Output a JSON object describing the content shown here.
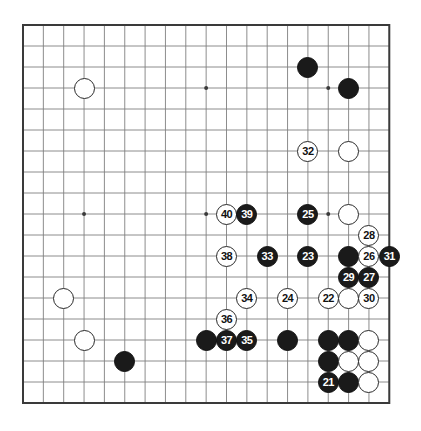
{
  "diagram": {
    "kind": "go-board-diagram",
    "board_size": 19,
    "colors": {
      "background": "#ffffff",
      "grid_line": "#808080",
      "border_line": "#3a3a3a",
      "black_stone": "#1a1a1a",
      "white_stone": "#ffffff",
      "stone_outline": "#2a2a2a",
      "black_label_text": "#ffffff",
      "white_label_text": "#111111"
    },
    "geometry": {
      "origin_x": 23,
      "origin_y": 25,
      "step_x": 20.35,
      "step_y": 21.0,
      "stone_diameter": 21,
      "star_point_radius": 2
    },
    "star_points": [
      {
        "col": 3,
        "row": 3
      },
      {
        "col": 9,
        "row": 3
      },
      {
        "col": 15,
        "row": 3
      },
      {
        "col": 3,
        "row": 9
      },
      {
        "col": 9,
        "row": 9
      },
      {
        "col": 15,
        "row": 9
      },
      {
        "col": 3,
        "row": 15
      },
      {
        "col": 9,
        "row": 15
      },
      {
        "col": 15,
        "row": 15
      }
    ],
    "stones": [
      {
        "col": 3,
        "row": 3,
        "color": "white",
        "label": ""
      },
      {
        "col": 14,
        "row": 2,
        "color": "black",
        "label": ""
      },
      {
        "col": 16,
        "row": 3,
        "color": "black",
        "label": ""
      },
      {
        "col": 14,
        "row": 6,
        "color": "white",
        "label": "32"
      },
      {
        "col": 16,
        "row": 6,
        "color": "white",
        "label": ""
      },
      {
        "col": 10,
        "row": 9,
        "color": "white",
        "label": "40"
      },
      {
        "col": 11,
        "row": 9,
        "color": "black",
        "label": "39"
      },
      {
        "col": 14,
        "row": 9,
        "color": "black",
        "label": "25"
      },
      {
        "col": 16,
        "row": 9,
        "color": "white",
        "label": ""
      },
      {
        "col": 17,
        "row": 10,
        "color": "white",
        "label": "28"
      },
      {
        "col": 10,
        "row": 11,
        "color": "white",
        "label": "38"
      },
      {
        "col": 12,
        "row": 11,
        "color": "black",
        "label": "33"
      },
      {
        "col": 14,
        "row": 11,
        "color": "black",
        "label": "23"
      },
      {
        "col": 16,
        "row": 11,
        "color": "black",
        "label": ""
      },
      {
        "col": 17,
        "row": 11,
        "color": "white",
        "label": "26"
      },
      {
        "col": 18,
        "row": 11,
        "color": "black",
        "label": "31"
      },
      {
        "col": 16,
        "row": 12,
        "color": "black",
        "label": "29"
      },
      {
        "col": 17,
        "row": 12,
        "color": "black",
        "label": "27"
      },
      {
        "col": 2,
        "row": 13,
        "color": "white",
        "label": ""
      },
      {
        "col": 11,
        "row": 13,
        "color": "white",
        "label": "34"
      },
      {
        "col": 13,
        "row": 13,
        "color": "white",
        "label": "24"
      },
      {
        "col": 15,
        "row": 13,
        "color": "white",
        "label": "22"
      },
      {
        "col": 16,
        "row": 13,
        "color": "white",
        "label": ""
      },
      {
        "col": 17,
        "row": 13,
        "color": "white",
        "label": "30"
      },
      {
        "col": 10,
        "row": 14,
        "color": "white",
        "label": "36"
      },
      {
        "col": 3,
        "row": 15,
        "color": "white",
        "label": ""
      },
      {
        "col": 9,
        "row": 15,
        "color": "black",
        "label": ""
      },
      {
        "col": 10,
        "row": 15,
        "color": "black",
        "label": "37"
      },
      {
        "col": 11,
        "row": 15,
        "color": "black",
        "label": "35"
      },
      {
        "col": 13,
        "row": 15,
        "color": "black",
        "label": ""
      },
      {
        "col": 15,
        "row": 15,
        "color": "black",
        "label": ""
      },
      {
        "col": 16,
        "row": 15,
        "color": "black",
        "label": ""
      },
      {
        "col": 17,
        "row": 15,
        "color": "white",
        "label": ""
      },
      {
        "col": 5,
        "row": 16,
        "color": "black",
        "label": ""
      },
      {
        "col": 15,
        "row": 16,
        "color": "black",
        "label": ""
      },
      {
        "col": 16,
        "row": 16,
        "color": "white",
        "label": ""
      },
      {
        "col": 17,
        "row": 16,
        "color": "white",
        "label": ""
      },
      {
        "col": 15,
        "row": 17,
        "color": "black",
        "label": "21"
      },
      {
        "col": 16,
        "row": 17,
        "color": "black",
        "label": ""
      },
      {
        "col": 17,
        "row": 17,
        "color": "white",
        "label": ""
      }
    ]
  }
}
